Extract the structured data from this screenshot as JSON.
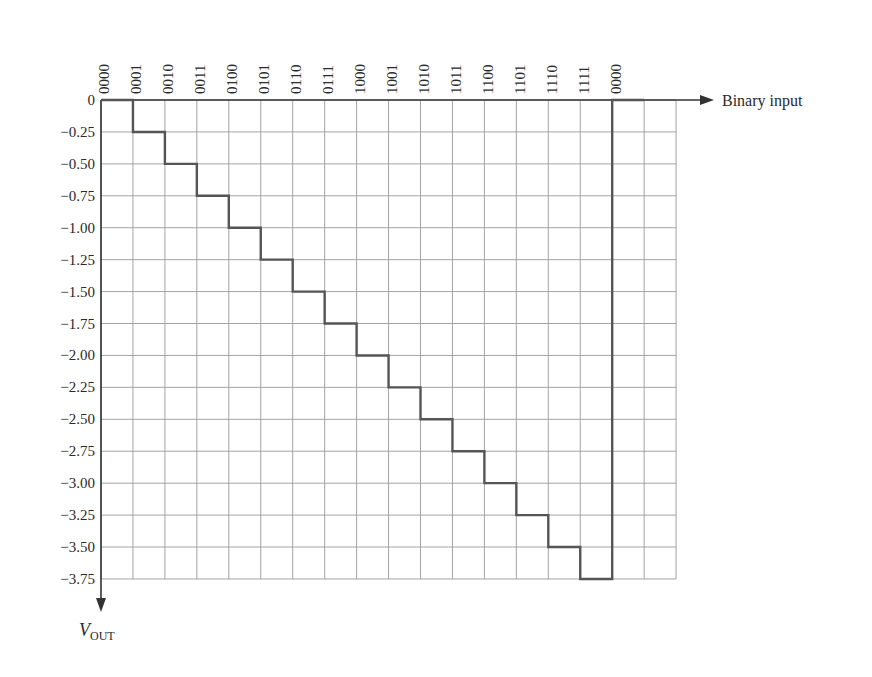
{
  "chart_data": {
    "type": "line",
    "subtype": "step",
    "title": "",
    "xlabel": "Binary input",
    "ylabel": "V_OUT",
    "ylabel_main": "V",
    "ylabel_sub": "OUT",
    "categories": [
      "0000",
      "0001",
      "0010",
      "0011",
      "0100",
      "0101",
      "0110",
      "0111",
      "1000",
      "1001",
      "1010",
      "1011",
      "1100",
      "1101",
      "1110",
      "1111",
      "0000"
    ],
    "values": [
      0,
      -0.25,
      -0.5,
      -0.75,
      -1.0,
      -1.25,
      -1.5,
      -1.75,
      -2.0,
      -2.25,
      -2.5,
      -2.75,
      -3.0,
      -3.25,
      -3.5,
      -3.75,
      0
    ],
    "y_ticks": [
      "0",
      "−0.25",
      "−0.50",
      "−0.75",
      "−1.00",
      "−1.25",
      "−1.50",
      "−1.75",
      "−2.00",
      "−2.25",
      "−2.50",
      "−2.75",
      "−3.00",
      "−3.25",
      "−3.50",
      "−3.75"
    ],
    "ylim": [
      -3.75,
      0
    ],
    "grid": true,
    "legend": null,
    "colors": {
      "grid": "#9a9a9a",
      "step_line": "#555555",
      "axis": "#333333",
      "text": "#2a2a2a"
    }
  }
}
